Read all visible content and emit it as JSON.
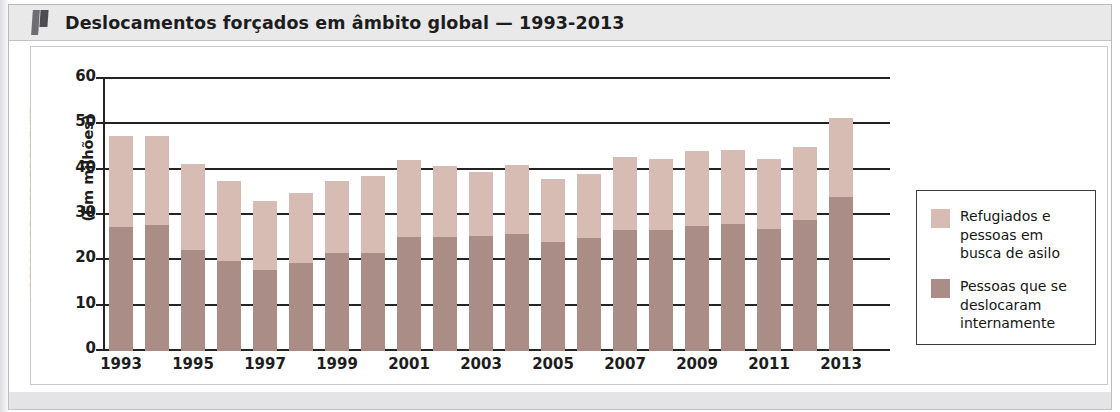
{
  "figure": {
    "title": "Deslocamentos forçados em âmbito global — 1993-2013",
    "credit": "ANDERSON DE ANDRADE PIMENTEL"
  },
  "colors": {
    "light": "#d7bcb4",
    "dark": "#ab8d87",
    "axis": "#232323",
    "title_band": "#e9e9ea"
  },
  "legend": {
    "position": "right",
    "items": [
      {
        "label": "Refugiados e pessoas em busca de asilo",
        "color": "#d7bcb4"
      },
      {
        "label": "Pessoas que se deslocaram internamente",
        "color": "#ab8d87"
      }
    ]
  },
  "chart_data": {
    "type": "bar",
    "stacked": true,
    "title": "Deslocamentos forçados em âmbito global — 1993-2013",
    "xlabel": "",
    "ylabel": "(Em milhões)",
    "ylim": [
      0,
      60
    ],
    "yticks": [
      0,
      10,
      20,
      30,
      40,
      50,
      60
    ],
    "grid": true,
    "categories": [
      "1993",
      "1994",
      "1995",
      "1996",
      "1997",
      "1998",
      "1999",
      "2000",
      "2001",
      "2002",
      "2003",
      "2004",
      "2005",
      "2006",
      "2007",
      "2008",
      "2009",
      "2010",
      "2011",
      "2012",
      "2013"
    ],
    "tick_labels": [
      "1993",
      "1995",
      "1997",
      "1999",
      "2001",
      "2003",
      "2005",
      "2007",
      "2009",
      "2011",
      "2013"
    ],
    "series": [
      {
        "name": "Pessoas que se deslocaram internamente",
        "color": "#ab8d87",
        "values": [
          27.4,
          27.9,
          22.3,
          19.8,
          17.8,
          19.4,
          21.6,
          21.7,
          25.2,
          25.2,
          25.3,
          25.8,
          24.0,
          24.9,
          26.7,
          26.8,
          27.5,
          28.0,
          26.9,
          28.8,
          33.9
        ]
      },
      {
        "name": "Refugiados e pessoas em busca de asilo",
        "color": "#d7bcb4",
        "values": [
          20.0,
          19.5,
          19.0,
          17.6,
          15.4,
          15.5,
          15.8,
          17.0,
          16.9,
          15.7,
          14.2,
          15.2,
          13.9,
          14.1,
          16.1,
          15.5,
          16.6,
          16.3,
          15.5,
          16.1,
          17.5
        ]
      }
    ],
    "totals": [
      47.4,
      47.4,
      41.3,
      37.4,
      33.2,
      34.9,
      37.4,
      38.7,
      42.1,
      40.9,
      39.5,
      41.0,
      37.9,
      39.0,
      42.8,
      42.3,
      44.1,
      44.3,
      42.4,
      44.9,
      51.4
    ]
  }
}
